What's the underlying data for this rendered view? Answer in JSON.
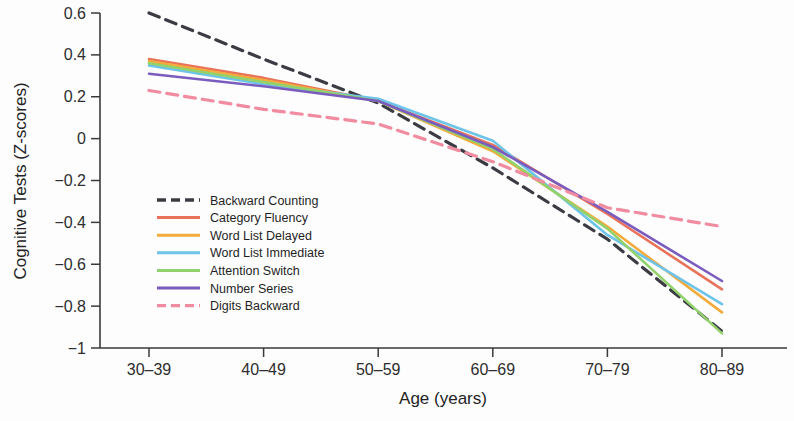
{
  "chart_data": {
    "type": "line",
    "title": "",
    "xlabel": "Age (years)",
    "ylabel": "Cognitive Tests (Z-scores)",
    "categories": [
      "30–39",
      "40–49",
      "50–59",
      "60–69",
      "70–79",
      "80–89"
    ],
    "ylim": [
      -1,
      0.6
    ],
    "yticks": [
      0.6,
      0.4,
      0.2,
      0,
      -0.2,
      -0.4,
      -0.6,
      -0.8,
      -1
    ],
    "ytick_labels": [
      "0.6",
      "0.4",
      "0.2",
      "0",
      "−0.2",
      "−0.4",
      "−0.6",
      "−0.8",
      "−1"
    ],
    "grid": false,
    "legend_position": "inner-left-middle",
    "series": [
      {
        "name": "Backward Counting",
        "color": "#3b3b44",
        "dash": "dashed",
        "values": [
          0.6,
          0.38,
          0.17,
          -0.14,
          -0.48,
          -0.92
        ]
      },
      {
        "name": "Category Fluency",
        "color": "#e8725a",
        "dash": "solid",
        "values": [
          0.38,
          0.29,
          0.18,
          -0.03,
          -0.36,
          -0.72
        ]
      },
      {
        "name": "Word List Delayed",
        "color": "#f3ab3c",
        "dash": "solid",
        "values": [
          0.37,
          0.28,
          0.18,
          -0.06,
          -0.42,
          -0.83
        ]
      },
      {
        "name": "Word List Immediate",
        "color": "#6ec3e8",
        "dash": "solid",
        "values": [
          0.35,
          0.26,
          0.19,
          -0.01,
          -0.46,
          -0.79
        ]
      },
      {
        "name": "Attention Switch",
        "color": "#92d16c",
        "dash": "solid",
        "values": [
          0.36,
          0.27,
          0.18,
          -0.05,
          -0.43,
          -0.93
        ]
      },
      {
        "name": "Number Series",
        "color": "#7a5cbf",
        "dash": "solid",
        "values": [
          0.31,
          0.25,
          0.18,
          -0.04,
          -0.35,
          -0.68
        ]
      },
      {
        "name": "Digits Backward",
        "color": "#f08ba0",
        "dash": "dashed",
        "values": [
          0.23,
          0.14,
          0.07,
          -0.11,
          -0.33,
          -0.42
        ]
      }
    ]
  },
  "axes": {
    "x_title": "Age (years)",
    "y_title": "Cognitive Tests (Z-scores)"
  },
  "legend": {
    "items": [
      {
        "label": "Backward Counting"
      },
      {
        "label": "Category Fluency"
      },
      {
        "label": "Word List Delayed"
      },
      {
        "label": "Word List Immediate"
      },
      {
        "label": "Attention Switch"
      },
      {
        "label": "Number Series"
      },
      {
        "label": "Digits Backward"
      }
    ]
  }
}
